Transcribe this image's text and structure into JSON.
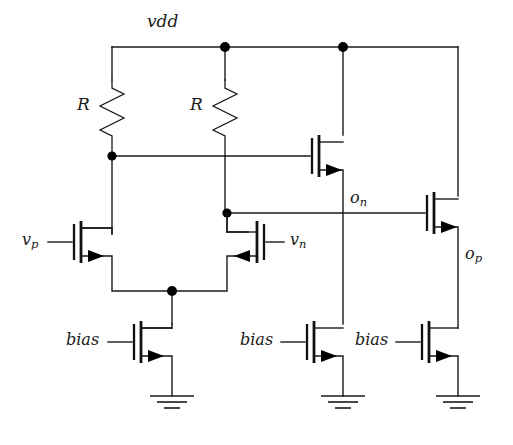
{
  "diagram": {
    "supply_label": "vdd",
    "ground_symbol": "gnd",
    "line_color": "#1a1a1a",
    "node_color": "#000000",
    "background": "#ffffff"
  },
  "labels": {
    "vdd": "vdd",
    "resistor_left": "R",
    "resistor_right": "R",
    "input_p": "v",
    "input_p_sub": "p",
    "input_n": "v",
    "input_n_sub": "n",
    "output_n": "o",
    "output_n_sub": "n",
    "output_p": "o",
    "output_p_sub": "p",
    "bias_left": "bias",
    "bias_mid": "bias",
    "bias_right": "bias"
  },
  "components": {
    "resistors": [
      {
        "name": "resistor-left",
        "label": "R"
      },
      {
        "name": "resistor-right",
        "label": "R"
      }
    ],
    "transistors": [
      {
        "name": "nmos-input-vp",
        "terminal_label": "v_p",
        "orientation": "gate-left"
      },
      {
        "name": "nmos-input-vn",
        "terminal_label": "v_n",
        "orientation": "gate-right"
      },
      {
        "name": "nmos-tail-bias",
        "terminal_label": "bias",
        "orientation": "gate-left"
      },
      {
        "name": "nmos-mirror-on",
        "terminal_label": "",
        "orientation": "gate-left"
      },
      {
        "name": "nmos-bias-mid",
        "terminal_label": "bias",
        "orientation": "gate-left"
      },
      {
        "name": "nmos-output-op",
        "terminal_label": "",
        "orientation": "gate-left"
      },
      {
        "name": "nmos-bias-right",
        "terminal_label": "bias",
        "orientation": "gate-left"
      }
    ],
    "grounds": [
      {
        "name": "ground-left"
      },
      {
        "name": "ground-mid"
      },
      {
        "name": "ground-right"
      }
    ],
    "junction_dots": [
      {
        "name": "node-vdd-mid",
        "x": 225,
        "y": 47
      },
      {
        "name": "node-vdd-right",
        "x": 343,
        "y": 47
      },
      {
        "name": "node-drain-left",
        "x": 112,
        "y": 156
      },
      {
        "name": "node-drain-right",
        "x": 227,
        "y": 213
      },
      {
        "name": "node-tail",
        "x": 172,
        "y": 291
      }
    ]
  }
}
